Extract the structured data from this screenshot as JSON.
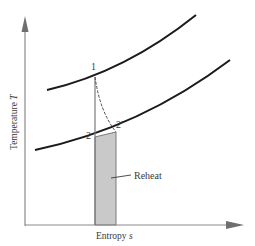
{
  "diagram": {
    "type": "T-s diagram (reheat)",
    "x_axis": {
      "label": "Entropy",
      "symbol": "s"
    },
    "y_axis": {
      "label": "Temperature",
      "symbol": "T"
    },
    "points": {
      "p1": "1",
      "p2": "2",
      "p2prime": "2′"
    },
    "annotation": {
      "reheat": "Reheat"
    },
    "colors": {
      "axis": "#8a8a8a",
      "curve": "#1a1a1a",
      "shade": "#c9c9c9",
      "shade_border": "#7a7a7a",
      "text": "#3a3a3a"
    }
  }
}
